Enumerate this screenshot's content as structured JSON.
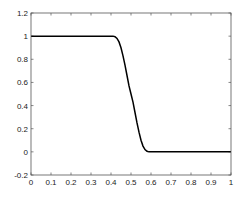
{
  "chart_data": {
    "type": "line",
    "title": "",
    "xlabel": "",
    "ylabel": "",
    "xlim": [
      0,
      1
    ],
    "ylim": [
      -0.2,
      1.2
    ],
    "grid": false,
    "legend": null,
    "x_ticks": [
      "0",
      "0.1",
      "0.2",
      "0.3",
      "0.4",
      "0.5",
      "0.6",
      "0.7",
      "0.8",
      "0.9",
      "1"
    ],
    "y_ticks": [
      "-0.2",
      "0",
      "0.2",
      "0.4",
      "0.6",
      "0.8",
      "1",
      "1.2"
    ],
    "series": [
      {
        "name": "curve",
        "color": "#000000",
        "x": [
          0,
          0.1,
          0.2,
          0.3,
          0.4,
          0.41,
          0.42,
          0.43,
          0.44,
          0.45,
          0.46,
          0.47,
          0.48,
          0.49,
          0.5,
          0.51,
          0.52,
          0.53,
          0.54,
          0.55,
          0.56,
          0.57,
          0.58,
          0.59,
          0.6,
          0.7,
          0.8,
          0.9,
          1
        ],
        "y": [
          1,
          1,
          1,
          1,
          1,
          1,
          0.995,
          0.98,
          0.95,
          0.9,
          0.83,
          0.75,
          0.66,
          0.57,
          0.5,
          0.43,
          0.34,
          0.25,
          0.17,
          0.1,
          0.05,
          0.02,
          0.005,
          0,
          0,
          0,
          0,
          0,
          0
        ]
      }
    ]
  }
}
